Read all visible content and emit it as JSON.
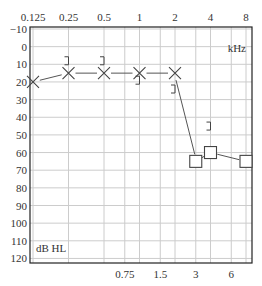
{
  "chart_data": {
    "type": "scatter",
    "xlabel": "kHz",
    "ylabel": "dB HL",
    "x_top_ticks": [
      "0.125",
      "0.25",
      "0.5",
      "1",
      "2",
      "4",
      "8"
    ],
    "x_bottom_ticks": [
      "0.75",
      "1.5",
      "3",
      "6"
    ],
    "y_ticks": [
      -10,
      0,
      10,
      20,
      30,
      40,
      50,
      60,
      70,
      80,
      90,
      100,
      110,
      120
    ],
    "ylim": [
      -10,
      120
    ],
    "y_inverted": true,
    "grid": true,
    "series": [
      {
        "name": "Air conduction (X)",
        "marker": "x",
        "connected": true,
        "x": [
          0.125,
          0.25,
          0.5,
          1,
          2
        ],
        "values": [
          20,
          15,
          15,
          15,
          15
        ]
      },
      {
        "name": "Air conduction masked (square)",
        "marker": "square",
        "connected": true,
        "x": [
          3,
          4,
          8
        ],
        "values": [
          65,
          60,
          65
        ]
      },
      {
        "name": "Bone conduction (])",
        "marker": "bracket",
        "connected": false,
        "x": [
          0.25,
          0.5,
          1,
          2,
          4
        ],
        "values": [
          8,
          8,
          19,
          24,
          45
        ]
      }
    ]
  },
  "labels": {
    "unit_x": "kHz",
    "unit_y": "dB HL"
  }
}
